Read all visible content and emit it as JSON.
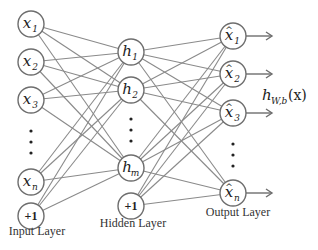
{
  "diagram": {
    "layers": {
      "input": {
        "title": "Input Layer",
        "nodes": [
          {
            "id": "x1",
            "base": "x",
            "sub": "1",
            "hat": false,
            "cx": 31,
            "cy": 24
          },
          {
            "id": "x2",
            "base": "x",
            "sub": "2",
            "hat": false,
            "cx": 31,
            "cy": 62
          },
          {
            "id": "x3",
            "base": "x",
            "sub": "3",
            "hat": false,
            "cx": 31,
            "cy": 100
          },
          {
            "id": "xn",
            "base": "x",
            "sub": "n",
            "hat": false,
            "cx": 31,
            "cy": 182
          },
          {
            "id": "bias_in",
            "base": "+1",
            "sub": "",
            "bias": true,
            "cx": 31,
            "cy": 216
          }
        ],
        "ellipsis_y": [
          131,
          142,
          153
        ],
        "title_pos": [
          37,
          235
        ]
      },
      "hidden": {
        "title": "Hidden Layer",
        "nodes": [
          {
            "id": "h1",
            "base": "h",
            "sub": "1",
            "hat": false,
            "cx": 131,
            "cy": 52
          },
          {
            "id": "h2",
            "base": "h",
            "sub": "2",
            "hat": false,
            "cx": 131,
            "cy": 90
          },
          {
            "id": "hm",
            "base": "h",
            "sub": "m",
            "hat": false,
            "cx": 131,
            "cy": 168
          },
          {
            "id": "bias_hid",
            "base": "+1",
            "sub": "",
            "bias": true,
            "cx": 131,
            "cy": 206
          }
        ],
        "ellipsis_y": [
          119,
          130,
          141
        ],
        "title_pos": [
          133,
          227
        ]
      },
      "output": {
        "title": "Output Layer",
        "nodes": [
          {
            "id": "xhat1",
            "base": "x",
            "sub": "1",
            "hat": true,
            "cx": 233,
            "cy": 36
          },
          {
            "id": "xhat2",
            "base": "x",
            "sub": "2",
            "hat": true,
            "cx": 233,
            "cy": 74
          },
          {
            "id": "xhat3",
            "base": "x",
            "sub": "3",
            "hat": true,
            "cx": 233,
            "cy": 113
          },
          {
            "id": "xhatn",
            "base": "x",
            "sub": "n",
            "hat": true,
            "cx": 233,
            "cy": 193
          }
        ],
        "ellipsis_y": [
          144,
          155,
          166
        ],
        "title_pos": [
          238,
          216
        ]
      }
    },
    "node_radius": 13,
    "output_function_label": {
      "base": "h",
      "sub": "W,b",
      "arg": "(x)",
      "x": 262,
      "y": 100
    },
    "arrow_end_x": 272,
    "colors": {
      "node_stroke": "#6e6e6e",
      "edge": "#8a8a8a",
      "text": "#222222"
    }
  }
}
